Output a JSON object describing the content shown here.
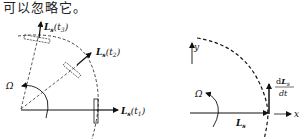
{
  "header": {
    "text": "可以忽略它。"
  },
  "left_diagram": {
    "omega_label": "Ω",
    "vector_t1": {
      "base": "L",
      "sub": "s",
      "arg": "(t",
      "argsub": "1",
      "close": ")"
    },
    "vector_t2": {
      "base": "L",
      "sub": "s",
      "arg": "(t",
      "argsub": "2",
      "close": ")"
    },
    "vector_t3": {
      "base": "L",
      "sub": "s",
      "arg": "(t",
      "argsub": "3",
      "close": ")"
    }
  },
  "right_diagram": {
    "omega_label": "Ω",
    "y_axis_label": "y",
    "x_axis_label": "x",
    "vector_label": {
      "base": "L",
      "sub": "s"
    },
    "derivative_label": {
      "num_d": "d",
      "num_base": "L",
      "num_sub": "s",
      "den": "dt"
    }
  },
  "colors": {
    "ink": "#111111",
    "background": "#ffffff"
  }
}
